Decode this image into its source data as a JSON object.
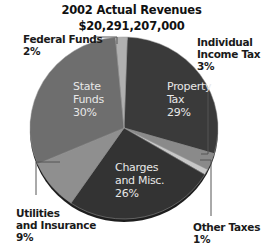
{
  "chart_data": {
    "type": "pie",
    "title": "2002 Actual Revenues",
    "subtitle": "$20,291,207,000",
    "categories": [
      "Property Tax",
      "Individual Income Tax",
      "Other Taxes",
      "Charges and Misc.",
      "Utilities and Insurance",
      "State Funds",
      "Federal Funds"
    ],
    "values": [
      29,
      3,
      1,
      26,
      9,
      30,
      2
    ],
    "unit": "%",
    "legend": "none (direct labels)",
    "colors": [
      "#3a3a3a",
      "#8a8a8a",
      "#c8c8c8",
      "#333333",
      "#8f8f8f",
      "#6e6e6e",
      "#b0b0b0"
    ]
  },
  "header": {
    "title": "2002 Actual Revenues",
    "total": "$20,291,207,000"
  },
  "labels": {
    "property_tax": {
      "line1": "Property",
      "line2": "Tax",
      "pct": "29%"
    },
    "state_funds": {
      "line1": "State",
      "line2": "Funds",
      "pct": "30%"
    },
    "charges": {
      "line1": "Charges",
      "line2": "and Misc.",
      "pct": "26%"
    },
    "federal_funds": {
      "line1": "Federal Funds",
      "pct": "2%"
    },
    "income_tax": {
      "line1": "Individual",
      "line2": "Income Tax",
      "pct": "3%"
    },
    "utilities": {
      "line1": "Utilities",
      "line2": "and Insurance",
      "pct": "9%"
    },
    "other_taxes": {
      "line1": "Other Taxes",
      "pct": "1%"
    }
  }
}
